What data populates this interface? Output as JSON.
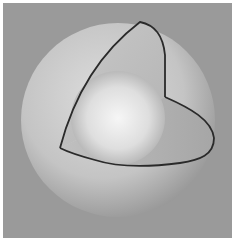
{
  "figure": {
    "background_color": "#9a9a9a",
    "border_color": "#ffffff",
    "outer_shell": {
      "label": "outer sphere shell",
      "color_light": "#d8d8d8",
      "color_dark": "#8c8c8c"
    },
    "inner_core": {
      "label": "inner sphere",
      "color_light": "#f4f4f4",
      "color_dark": "#9c9c9c"
    },
    "cut_edge_color": "#2a2a2a"
  }
}
